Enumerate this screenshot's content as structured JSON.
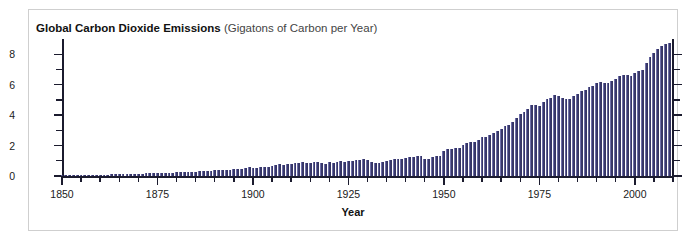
{
  "clipped_header": {
    "text": ""
  },
  "chart_data": {
    "type": "bar",
    "title_main": "Global Carbon Dioxide Emissions",
    "title_sub": "(Gigatons of Carbon per Year)",
    "xlabel": "Year",
    "ylabel": "",
    "xlim": [
      1850,
      2010
    ],
    "ylim": [
      0,
      9
    ],
    "grid": false,
    "legend": null,
    "bar_color": "#3f3f77",
    "axis_color": "#1b1b2e",
    "y_ticks_major": [
      0,
      2,
      4,
      6,
      8
    ],
    "y_ticks_minor": [
      1,
      3,
      5,
      7
    ],
    "x_ticks_major": [
      1850,
      1875,
      1900,
      1925,
      1950,
      1975,
      2000
    ],
    "x_ticks_minor": [
      1855,
      1860,
      1865,
      1870,
      1880,
      1885,
      1890,
      1895,
      1905,
      1910,
      1915,
      1920,
      1930,
      1935,
      1940,
      1945,
      1955,
      1960,
      1965,
      1970,
      1980,
      1985,
      1990,
      1995,
      2005,
      2010
    ],
    "x": [
      1850,
      1851,
      1852,
      1853,
      1854,
      1855,
      1856,
      1857,
      1858,
      1859,
      1860,
      1861,
      1862,
      1863,
      1864,
      1865,
      1866,
      1867,
      1868,
      1869,
      1870,
      1871,
      1872,
      1873,
      1874,
      1875,
      1876,
      1877,
      1878,
      1879,
      1880,
      1881,
      1882,
      1883,
      1884,
      1885,
      1886,
      1887,
      1888,
      1889,
      1890,
      1891,
      1892,
      1893,
      1894,
      1895,
      1896,
      1897,
      1898,
      1899,
      1900,
      1901,
      1902,
      1903,
      1904,
      1905,
      1906,
      1907,
      1908,
      1909,
      1910,
      1911,
      1912,
      1913,
      1914,
      1915,
      1916,
      1917,
      1918,
      1919,
      1920,
      1921,
      1922,
      1923,
      1924,
      1925,
      1926,
      1927,
      1928,
      1929,
      1930,
      1931,
      1932,
      1933,
      1934,
      1935,
      1936,
      1937,
      1938,
      1939,
      1940,
      1941,
      1942,
      1943,
      1944,
      1945,
      1946,
      1947,
      1948,
      1949,
      1950,
      1951,
      1952,
      1953,
      1954,
      1955,
      1956,
      1957,
      1958,
      1959,
      1960,
      1961,
      1962,
      1963,
      1964,
      1965,
      1966,
      1967,
      1968,
      1969,
      1970,
      1971,
      1972,
      1973,
      1974,
      1975,
      1976,
      1977,
      1978,
      1979,
      1980,
      1981,
      1982,
      1983,
      1984,
      1985,
      1986,
      1987,
      1988,
      1989,
      1990,
      1991,
      1992,
      1993,
      1994,
      1995,
      1996,
      1997,
      1998,
      1999,
      2000,
      2001,
      2002,
      2003,
      2004,
      2005,
      2006,
      2007,
      2008,
      2009
    ],
    "values": [
      0.05,
      0.05,
      0.05,
      0.06,
      0.07,
      0.07,
      0.08,
      0.08,
      0.09,
      0.09,
      0.09,
      0.09,
      0.09,
      0.1,
      0.11,
      0.11,
      0.12,
      0.12,
      0.13,
      0.13,
      0.15,
      0.16,
      0.17,
      0.18,
      0.18,
      0.19,
      0.2,
      0.2,
      0.2,
      0.22,
      0.24,
      0.25,
      0.26,
      0.28,
      0.28,
      0.29,
      0.3,
      0.31,
      0.33,
      0.34,
      0.37,
      0.39,
      0.39,
      0.41,
      0.42,
      0.45,
      0.47,
      0.49,
      0.52,
      0.56,
      0.53,
      0.55,
      0.56,
      0.62,
      0.62,
      0.65,
      0.71,
      0.78,
      0.74,
      0.78,
      0.82,
      0.83,
      0.87,
      0.94,
      0.85,
      0.84,
      0.9,
      0.93,
      0.85,
      0.78,
      0.92,
      0.83,
      0.9,
      0.98,
      0.95,
      0.98,
      0.99,
      1.07,
      1.07,
      1.13,
      1.05,
      0.94,
      0.85,
      0.87,
      0.94,
      0.99,
      1.08,
      1.15,
      1.11,
      1.14,
      1.2,
      1.24,
      1.25,
      1.29,
      1.31,
      1.15,
      1.14,
      1.26,
      1.33,
      1.29,
      1.63,
      1.77,
      1.8,
      1.84,
      1.86,
      2.04,
      2.15,
      2.22,
      2.24,
      2.35,
      2.54,
      2.58,
      2.69,
      2.83,
      2.99,
      3.09,
      3.26,
      3.38,
      3.57,
      3.78,
      4.05,
      4.21,
      4.39,
      4.65,
      4.64,
      4.61,
      4.89,
      5.03,
      5.12,
      5.33,
      5.27,
      5.11,
      5.07,
      5.08,
      5.24,
      5.4,
      5.58,
      5.67,
      5.82,
      5.9,
      6.13,
      6.16,
      6.11,
      6.13,
      6.25,
      6.39,
      6.56,
      6.62,
      6.61,
      6.58,
      6.77,
      6.89,
      6.99,
      7.41,
      7.81,
      8.08,
      8.35,
      8.53,
      8.67,
      8.74
    ],
    "annotations": []
  },
  "ui": {
    "panel_border_color": "#cfcfcf",
    "background": "#ffffff"
  }
}
